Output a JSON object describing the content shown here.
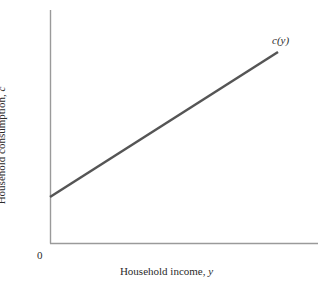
{
  "chart_data": {
    "type": "line",
    "title": "",
    "xlabel": "Household income, y",
    "ylabel": "Household consumption, c",
    "origin_label": "0",
    "annotations": [
      {
        "text": "c(y)",
        "x": 278,
        "y": 52,
        "style": "italic"
      }
    ],
    "series": [
      {
        "name": "c(y)",
        "label": "c(y)",
        "comment": "Linear consumption function with positive intercept (autonomous consumption) and slope less than 1 (marginal propensity to consume).",
        "x": [
          0,
          100
        ],
        "y": [
          20,
          80
        ],
        "points_px": [
          [
            50,
            197
          ],
          [
            278,
            52
          ]
        ],
        "color": "#555555",
        "width": 2.5
      }
    ],
    "xlim": [
      0,
      117
    ],
    "ylim": [
      0,
      100
    ],
    "grid": false,
    "legend": false,
    "axes": {
      "color": "#9a9a9a",
      "width": 1,
      "y_axis_px": {
        "x": 50,
        "y_top": 10,
        "y_bottom": 243
      },
      "x_axis_px": {
        "y": 243,
        "x_left": 50,
        "x_right": 318
      }
    },
    "background": "#ffffff"
  },
  "figure": {
    "curve_label": "c(y)",
    "origin": "0",
    "x_axis_title_main": "Household income, ",
    "x_axis_title_var": "y",
    "y_axis_title_main": "Household consumption, ",
    "y_axis_title_var": "c"
  }
}
